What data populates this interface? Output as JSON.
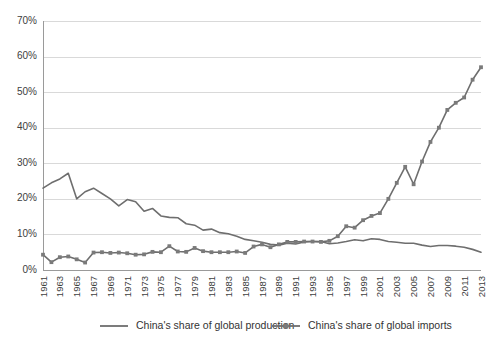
{
  "chart_data": {
    "type": "line",
    "title": "",
    "xlabel": "",
    "ylabel": "",
    "ylim": [
      0,
      70
    ],
    "ytick_labels": [
      "0%",
      "10%",
      "20%",
      "30%",
      "40%",
      "50%",
      "60%",
      "70%"
    ],
    "ytick_values": [
      0,
      10,
      20,
      30,
      40,
      50,
      60,
      70
    ],
    "grid": true,
    "legend_position": "bottom",
    "x": [
      1961,
      1962,
      1963,
      1964,
      1965,
      1966,
      1967,
      1968,
      1969,
      1970,
      1971,
      1972,
      1973,
      1974,
      1975,
      1976,
      1977,
      1978,
      1979,
      1980,
      1981,
      1982,
      1983,
      1984,
      1985,
      1986,
      1987,
      1988,
      1989,
      1990,
      1991,
      1992,
      1993,
      1994,
      1995,
      1996,
      1997,
      1998,
      1999,
      2000,
      2001,
      2002,
      2003,
      2004,
      2005,
      2006,
      2007,
      2008,
      2009,
      2010,
      2011,
      2012,
      2013
    ],
    "xtick_labels": [
      "1961",
      "1963",
      "1965",
      "1967",
      "1969",
      "1971",
      "1973",
      "1975",
      "1977",
      "1979",
      "1981",
      "1983",
      "1985",
      "1987",
      "1989",
      "1991",
      "1993",
      "1995",
      "1997",
      "1999",
      "2001",
      "2003",
      "2005",
      "2007",
      "2009",
      "2011",
      "2013"
    ],
    "series": [
      {
        "name": "China's share of global production",
        "marker": "none",
        "color": "#6e6e6e",
        "values": [
          23.0,
          24.5,
          25.6,
          27.2,
          20.0,
          22.0,
          23.0,
          21.5,
          20.0,
          18.0,
          19.8,
          19.2,
          16.5,
          17.3,
          15.2,
          14.8,
          14.7,
          13.0,
          12.6,
          11.2,
          11.5,
          10.5,
          10.2,
          9.5,
          8.6,
          8.2,
          7.8,
          7.2,
          7.0,
          7.5,
          7.3,
          7.9,
          8.0,
          8.0,
          7.4,
          7.6,
          8.0,
          8.5,
          8.2,
          8.8,
          8.6,
          8.0,
          7.8,
          7.5,
          7.5,
          7.0,
          6.6,
          6.9,
          6.9,
          6.7,
          6.4,
          5.8,
          5.0
        ]
      },
      {
        "name": "China's share of global imports",
        "marker": "square",
        "color": "#7a7a7a",
        "values": [
          4.3,
          2.2,
          3.6,
          3.8,
          3.0,
          2.1,
          4.9,
          5.0,
          4.8,
          4.9,
          4.7,
          4.3,
          4.4,
          5.1,
          5.0,
          6.7,
          5.2,
          5.1,
          6.2,
          5.3,
          5.0,
          5.0,
          5.0,
          5.2,
          4.8,
          6.6,
          7.2,
          6.4,
          7.2,
          7.9,
          7.9,
          8.0,
          8.0,
          7.9,
          8.2,
          9.5,
          12.3,
          11.9,
          14.0,
          15.2,
          16.0,
          20.0,
          24.5,
          29.0,
          24.1,
          30.5,
          36.0,
          40.0,
          45.0,
          47.0,
          48.5,
          53.5,
          57.0
        ]
      }
    ]
  },
  "legend": {
    "items": [
      {
        "label": "China's share of global production",
        "marker": "line"
      },
      {
        "label": "China's share of global imports",
        "marker": "line-square"
      }
    ]
  }
}
